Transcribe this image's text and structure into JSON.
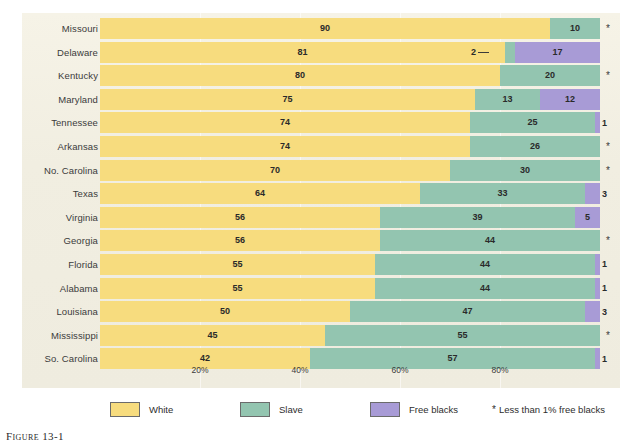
{
  "figure": {
    "caption_label": "Figure",
    "caption_number": "13-1"
  },
  "chart_data": {
    "type": "bar",
    "orientation": "horizontal",
    "stacked": true,
    "title": "",
    "xlabel": "",
    "ylabel": "",
    "xlim": [
      0,
      100
    ],
    "grid": true,
    "legend_position": "bottom",
    "tick_labels": [
      "20%",
      "40%",
      "60%",
      "80%"
    ],
    "tick_values": [
      20,
      40,
      60,
      80
    ],
    "categories": [
      "Missouri",
      "Delaware",
      "Kentucky",
      "Maryland",
      "Tennessee",
      "Arkansas",
      "No. Carolina",
      "Texas",
      "Virginia",
      "Georgia",
      "Florida",
      "Alabama",
      "Louisiana",
      "Mississippi",
      "So. Carolina"
    ],
    "series": [
      {
        "name": "White",
        "color": "#f7dc7e",
        "values": [
          90,
          81,
          80,
          75,
          74,
          74,
          70,
          64,
          56,
          56,
          55,
          55,
          50,
          45,
          42
        ]
      },
      {
        "name": "Slave",
        "color": "#93c5b0",
        "values": [
          10,
          2,
          20,
          13,
          25,
          26,
          30,
          33,
          39,
          44,
          44,
          44,
          47,
          55,
          57
        ]
      },
      {
        "name": "Free blacks",
        "color": "#a89bd6",
        "values": [
          0,
          17,
          0,
          12,
          1,
          0,
          0,
          3,
          5,
          0,
          1,
          1,
          3,
          0,
          1
        ]
      }
    ],
    "footnote_symbol": "*",
    "footnote_text": "Less than 1% free blacks",
    "rows": [
      {
        "state": "Missouri",
        "white": 90,
        "white_label": "90",
        "slave": 10,
        "slave_label": "10",
        "free": 0,
        "free_label": "",
        "star": "*"
      },
      {
        "state": "Delaware",
        "white": 81,
        "white_label": "81",
        "slave": 2,
        "slave_label": "2",
        "free": 17,
        "free_label": "17",
        "star": ""
      },
      {
        "state": "Kentucky",
        "white": 80,
        "white_label": "80",
        "slave": 20,
        "slave_label": "20",
        "free": 0,
        "free_label": "",
        "star": "*"
      },
      {
        "state": "Maryland",
        "white": 75,
        "white_label": "75",
        "slave": 13,
        "slave_label": "13",
        "free": 12,
        "free_label": "12",
        "star": ""
      },
      {
        "state": "Tennessee",
        "white": 74,
        "white_label": "74",
        "slave": 25,
        "slave_label": "25",
        "free": 1,
        "free_label": "1",
        "star": ""
      },
      {
        "state": "Arkansas",
        "white": 74,
        "white_label": "74",
        "slave": 26,
        "slave_label": "26",
        "free": 0,
        "free_label": "",
        "star": "*"
      },
      {
        "state": "No. Carolina",
        "white": 70,
        "white_label": "70",
        "slave": 30,
        "slave_label": "30",
        "free": 0,
        "free_label": "",
        "star": "*"
      },
      {
        "state": "Texas",
        "white": 64,
        "white_label": "64",
        "slave": 33,
        "slave_label": "33",
        "free": 3,
        "free_label": "3",
        "star": ""
      },
      {
        "state": "Virginia",
        "white": 56,
        "white_label": "56",
        "slave": 39,
        "slave_label": "39",
        "free": 5,
        "free_label": "5",
        "star": ""
      },
      {
        "state": "Georgia",
        "white": 56,
        "white_label": "56",
        "slave": 44,
        "slave_label": "44",
        "free": 0,
        "free_label": "",
        "star": "*"
      },
      {
        "state": "Florida",
        "white": 55,
        "white_label": "55",
        "slave": 44,
        "slave_label": "44",
        "free": 1,
        "free_label": "1",
        "star": ""
      },
      {
        "state": "Alabama",
        "white": 55,
        "white_label": "55",
        "slave": 44,
        "slave_label": "44",
        "free": 1,
        "free_label": "1",
        "star": ""
      },
      {
        "state": "Louisiana",
        "white": 50,
        "white_label": "50",
        "slave": 47,
        "slave_label": "47",
        "free": 3,
        "free_label": "3",
        "star": ""
      },
      {
        "state": "Mississippi",
        "white": 45,
        "white_label": "45",
        "slave": 55,
        "slave_label": "55",
        "free": 0,
        "free_label": "",
        "star": "*"
      },
      {
        "state": "So. Carolina",
        "white": 42,
        "white_label": "42",
        "slave": 57,
        "slave_label": "57",
        "free": 1,
        "free_label": "1",
        "star": ""
      }
    ]
  },
  "legend": {
    "items": [
      {
        "label": "White",
        "color": "#f7dc7e"
      },
      {
        "label": "Slave",
        "color": "#93c5b0"
      },
      {
        "label": "Free blacks",
        "color": "#a89bd6"
      }
    ],
    "note_symbol": "*",
    "note_text": "Less than 1% free blacks"
  },
  "colors": {
    "white_seg": "#f7dc7e",
    "slave_seg": "#93c5b0",
    "free_seg": "#a89bd6",
    "panel_bg": "#f1eee1",
    "page_bg": "#ffffff",
    "text": "#2e2e2e"
  }
}
